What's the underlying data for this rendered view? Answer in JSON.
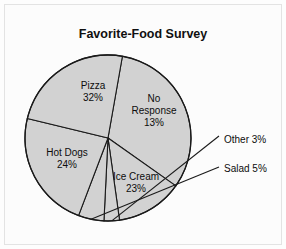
{
  "chart_data": {
    "type": "pie",
    "title": "Favorite-Food Survey",
    "xlabel": "",
    "ylabel": "",
    "legend": "none",
    "grid": false,
    "unit": "%",
    "start_angle_deg": -80,
    "direction": "clockwise",
    "categories": [
      "Pizza",
      "No Response",
      "Other",
      "Salad",
      "Ice Cream",
      "Hot Dogs"
    ],
    "values": [
      32,
      13,
      3,
      5,
      23,
      24
    ],
    "slices": [
      {
        "name": "Pizza",
        "label": "Pizza",
        "value": 32,
        "value_label": "32%",
        "label_style": "inside",
        "label_x": 93,
        "label_y": 89,
        "value_x": 93,
        "value_y": 101
      },
      {
        "name": "No Response",
        "label": "No",
        "label2": "Response",
        "value": 13,
        "value_label": "13%",
        "label_style": "inside",
        "label_x": 154,
        "label_y": 102,
        "label2_x": 154,
        "label2_y": 114,
        "value_x": 154,
        "value_y": 126
      },
      {
        "name": "Other",
        "label": "Other 3%",
        "value": 3,
        "value_label": "3%",
        "label_style": "callout",
        "label_x": 224,
        "label_y": 143
      },
      {
        "name": "Salad",
        "label": "Salad 5%",
        "value": 5,
        "value_label": "5%",
        "label_style": "callout",
        "label_x": 224,
        "label_y": 172
      },
      {
        "name": "Ice Cream",
        "label": "Ice Cream",
        "value": 23,
        "value_label": "23%",
        "label_style": "inside",
        "label_x": 136,
        "label_y": 180,
        "value_x": 136,
        "value_y": 192
      },
      {
        "name": "Hot Dogs",
        "label": "Hot Dogs",
        "value": 24,
        "value_label": "24%",
        "label_style": "inside",
        "label_x": 67,
        "label_y": 156,
        "value_x": 67,
        "value_y": 168
      }
    ],
    "colors": {
      "slice_fill": "#d2d2d2",
      "slice_stroke": "#1a1a1a",
      "background": "#fcfcfc",
      "frame": "#e3e3e3",
      "text": "#0d0d0d"
    },
    "geometry": {
      "center_x": 108,
      "center_y": 138,
      "radius": 83,
      "title_x": 143,
      "title_y": 38
    }
  }
}
